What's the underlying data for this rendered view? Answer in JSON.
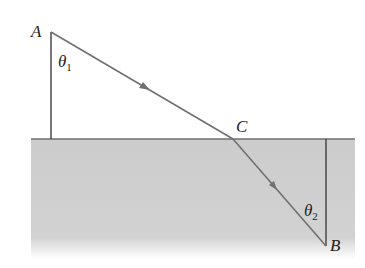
{
  "diagram": {
    "labels": {
      "point_a": "A",
      "point_b": "B",
      "point_c": "C",
      "theta1": "θ",
      "theta1_sub": "1",
      "theta2": "θ",
      "theta2_sub": "2"
    },
    "colors": {
      "medium": "#cfcfcf",
      "ray": "#6e6e6e",
      "line": "#4a4a4a",
      "surface": "#6f6f6f"
    }
  }
}
